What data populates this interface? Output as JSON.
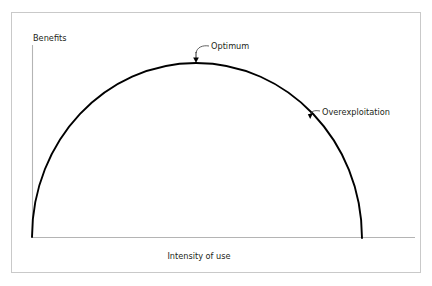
{
  "figure": {
    "type": "line-chart-diagram",
    "background_color": "#ffffff",
    "frame": {
      "name": "outer-border",
      "color": "#c9c9c9",
      "x": 11,
      "y": 12,
      "width": 409,
      "height": 260
    },
    "axes": {
      "color": "#b4b4b4",
      "y_axis": {
        "x": 32,
        "y_top": 45,
        "y_bottom": 237
      },
      "x_axis": {
        "y": 237,
        "x_left": 32,
        "x_right": 415
      },
      "y_axis_label": "Benefits",
      "x_axis_label": "Intensity of use"
    },
    "annotations": [
      {
        "name": "optimum",
        "label": "Optimum",
        "label_x": 211,
        "label_y": 46,
        "arrow_tip_x": 196,
        "arrow_tip_y": 62,
        "leader_path": "M 209 46 C 203 45, 197 47, 196 53"
      },
      {
        "name": "overexploitation",
        "label": "Overexploitation",
        "label_x": 322,
        "label_y": 112,
        "arrow_tip_x": 310,
        "arrow_tip_y": 118,
        "leader_path": "M 320 111 C 314 110, 311 111, 310 116"
      }
    ]
  },
  "chart_data": {
    "type": "line",
    "title": "",
    "subtitle": "",
    "xlabel": "Intensity of use",
    "ylabel": "Benefits",
    "legend": [],
    "legend_position": "none",
    "grid": false,
    "axis_ticks": {
      "x": [],
      "y": []
    },
    "xlim": [
      0,
      1
    ],
    "ylim": [
      0,
      1
    ],
    "curve_color": "#000000",
    "curve_width": 1.9,
    "shape": "inverted-U (semi-ellipse)",
    "annotations": [
      "Optimum",
      "Overexploitation"
    ],
    "series": [
      {
        "name": "Benefits vs intensity of use",
        "x": [
          0.0,
          0.05,
          0.1,
          0.15,
          0.2,
          0.25,
          0.3,
          0.35,
          0.4,
          0.45,
          0.5,
          0.55,
          0.6,
          0.65,
          0.7,
          0.75,
          0.8,
          0.85,
          0.9,
          0.95,
          1.0
        ],
        "y": [
          0.0,
          0.312,
          0.436,
          0.527,
          0.6,
          0.661,
          0.714,
          0.76,
          0.8,
          0.835,
          0.866,
          0.893,
          0.917,
          0.937,
          0.954,
          0.968,
          0.98,
          0.989,
          0.995,
          0.999,
          1.0
        ]
      }
    ],
    "pixel_geometry": {
      "left_foot": [
        32,
        237
      ],
      "apex": [
        196,
        63
      ],
      "right_foot": [
        362,
        238
      ],
      "semi_axis_x": 165,
      "semi_axis_y": 174
    }
  }
}
